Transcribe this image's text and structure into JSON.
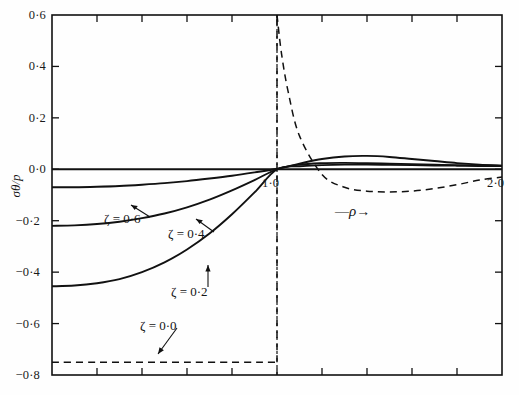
{
  "figure": {
    "name": "stress-distribution-plot",
    "background_color": "#fefefe",
    "line_color": "#111111"
  },
  "axes": {
    "y_title": "σθ/p",
    "x_title_prefix": "—",
    "x_title_symbol": "ρ",
    "x_title_arrow": "→",
    "x_labels": [
      {
        "text": "1·0",
        "value": 1.0
      },
      {
        "text": "2·0",
        "value": 2.0
      }
    ],
    "y_labels": [
      {
        "text": "0·6",
        "value": 0.6
      },
      {
        "text": "0·4",
        "value": 0.4
      },
      {
        "text": "0·2",
        "value": 0.2
      },
      {
        "text": "0·0",
        "value": 0.0
      },
      {
        "text": "−0·2",
        "value": -0.2
      },
      {
        "text": "−0·4",
        "value": -0.4
      },
      {
        "text": "−0·6",
        "value": -0.6
      },
      {
        "text": "−0·8",
        "value": -0.8
      }
    ]
  },
  "annotations": [
    {
      "name": "curve-label-zeta-06",
      "text": "ζ = 0·6"
    },
    {
      "name": "curve-label-zeta-04",
      "text": "ζ = 0·4"
    },
    {
      "name": "curve-label-zeta-02",
      "text": "ζ = 0·2"
    },
    {
      "name": "curve-label-zeta-00",
      "text": "ζ = 0·0"
    }
  ],
  "chart_data": {
    "type": "line",
    "title": "",
    "xlabel": "ρ",
    "ylabel": "σθ/p",
    "xlim": [
      0.0,
      2.0
    ],
    "ylim": [
      -0.8,
      0.6
    ],
    "grid": false,
    "legend": "inline-annotations",
    "x_tick_interval": 0.2,
    "y_tick_interval": 0.2,
    "vertical_reference_line": {
      "x": 1.0,
      "style": "dotted"
    },
    "series": [
      {
        "name": "ζ = 0·6",
        "label": "ζ = 0·6",
        "style": "solid",
        "x": [
          0.0,
          0.1,
          0.2,
          0.3,
          0.4,
          0.5,
          0.6,
          0.7,
          0.8,
          0.9,
          1.0,
          1.1,
          1.2,
          1.3,
          1.4,
          1.5,
          1.6,
          1.7,
          1.8,
          1.9,
          2.0
        ],
        "y": [
          -0.07,
          -0.07,
          -0.068,
          -0.065,
          -0.06,
          -0.054,
          -0.046,
          -0.036,
          -0.025,
          -0.012,
          0.002,
          0.022,
          0.04,
          0.05,
          0.052,
          0.048,
          0.04,
          0.032,
          0.024,
          0.018,
          0.014
        ]
      },
      {
        "name": "ζ = 0·4",
        "label": "ζ = 0·4",
        "style": "solid",
        "x": [
          0.0,
          0.1,
          0.2,
          0.3,
          0.4,
          0.5,
          0.6,
          0.7,
          0.8,
          0.9,
          1.0,
          1.1,
          1.2,
          1.3,
          1.4,
          1.5,
          1.6,
          1.7,
          1.8,
          1.9,
          2.0
        ],
        "y": [
          -0.22,
          -0.218,
          -0.213,
          -0.204,
          -0.19,
          -0.172,
          -0.148,
          -0.118,
          -0.082,
          -0.042,
          0.0,
          0.018,
          0.024,
          0.025,
          0.024,
          0.022,
          0.02,
          0.018,
          0.016,
          0.015,
          0.014
        ]
      },
      {
        "name": "ζ = 0·2",
        "label": "ζ = 0·2",
        "style": "solid",
        "x": [
          0.0,
          0.1,
          0.2,
          0.3,
          0.4,
          0.5,
          0.6,
          0.7,
          0.8,
          0.9,
          1.0,
          1.1,
          1.2,
          1.3,
          1.4,
          1.5,
          1.6,
          1.7,
          1.8,
          1.9,
          2.0
        ],
        "y": [
          -0.455,
          -0.452,
          -0.443,
          -0.427,
          -0.4,
          -0.362,
          -0.312,
          -0.25,
          -0.175,
          -0.09,
          0.0,
          0.012,
          0.016,
          0.018,
          0.018,
          0.017,
          0.016,
          0.015,
          0.014,
          0.013,
          0.013
        ]
      },
      {
        "name": "ζ = 0·0",
        "label": "ζ = 0·0",
        "style": "dashed",
        "note": "discontinuous at ρ = 1·0",
        "x": [
          0.0,
          0.2,
          0.4,
          0.6,
          0.8,
          0.9,
          0.95,
          1.0,
          1.0,
          1.02,
          1.05,
          1.1,
          1.2,
          1.3,
          1.4,
          1.5,
          1.6,
          1.7,
          1.8,
          1.9,
          2.0
        ],
        "y": [
          -0.75,
          -0.75,
          -0.75,
          -0.75,
          -0.75,
          -0.75,
          -0.75,
          -0.75,
          0.6,
          0.45,
          0.3,
          0.13,
          -0.02,
          -0.07,
          -0.085,
          -0.088,
          -0.085,
          -0.075,
          -0.06,
          -0.042,
          -0.03
        ]
      },
      {
        "name": "zero-line",
        "label": "",
        "style": "solid",
        "x": [
          0.0,
          2.0
        ],
        "y": [
          0.0,
          0.0
        ]
      }
    ]
  }
}
